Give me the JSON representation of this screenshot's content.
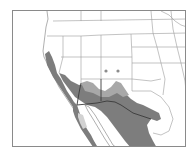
{
  "map": {
    "region": "Western United States and northern Mexico",
    "colors": {
      "background": "#ffffff",
      "land": "#ffffff",
      "range_primary": "#7d7d7d",
      "range_secondary": "#b4b4b4",
      "range_light": "#d2d2d2",
      "state_border": "#9a9a9a",
      "international_border": "#3a3a3a",
      "frame": "#8a8a8a",
      "occurrence_dot": "#8c8c8c"
    },
    "layers": [
      {
        "name": "primary-range",
        "shade": "dark grey"
      },
      {
        "name": "secondary-range",
        "shade": "medium grey"
      },
      {
        "name": "isolated-range",
        "shade": "light grey",
        "location": "Baja California peninsula"
      }
    ],
    "markers": [
      {
        "name": "occurrence-dot-1",
        "x": 105,
        "y": 70
      },
      {
        "name": "occurrence-dot-2",
        "x": 117,
        "y": 70
      }
    ]
  }
}
